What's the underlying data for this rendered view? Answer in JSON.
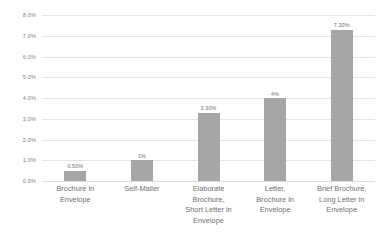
{
  "chart_data": {
    "type": "bar",
    "title": "",
    "subtitle": "",
    "xlabel": "",
    "ylabel": "",
    "categories": [
      "Brochure in\nEnvelope",
      "Self-Mailer",
      "Elaborate\nBrochure,\nShort Letter in\nEnvelope",
      "Letter,\nBrochure in\nEnvelope",
      "Brief Brochure,\nLong Letter in\nEnvelope"
    ],
    "values": [
      0.5,
      1.0,
      3.3,
      4.0,
      7.3
    ],
    "data_labels": [
      "0.50%",
      "1%",
      "3.30%",
      "4%",
      "7.30%"
    ],
    "ylim": [
      0,
      8
    ],
    "ytick_values": [
      0,
      1,
      2,
      3,
      4,
      5,
      6,
      7,
      8
    ],
    "ytick_labels": [
      "0.0%",
      "1.0%",
      "2.0%",
      "3.0%",
      "4.0%",
      "5.0%",
      "6.0%",
      "7.0%",
      "8.0%"
    ],
    "grid": true,
    "grid_axis": "y",
    "legend": false,
    "legend_position": "none",
    "bar_color": "#a6a6a6",
    "gridline_color": "#e4e4e4",
    "label_color": "#6f6f6f",
    "background_color": "#ffffff"
  }
}
